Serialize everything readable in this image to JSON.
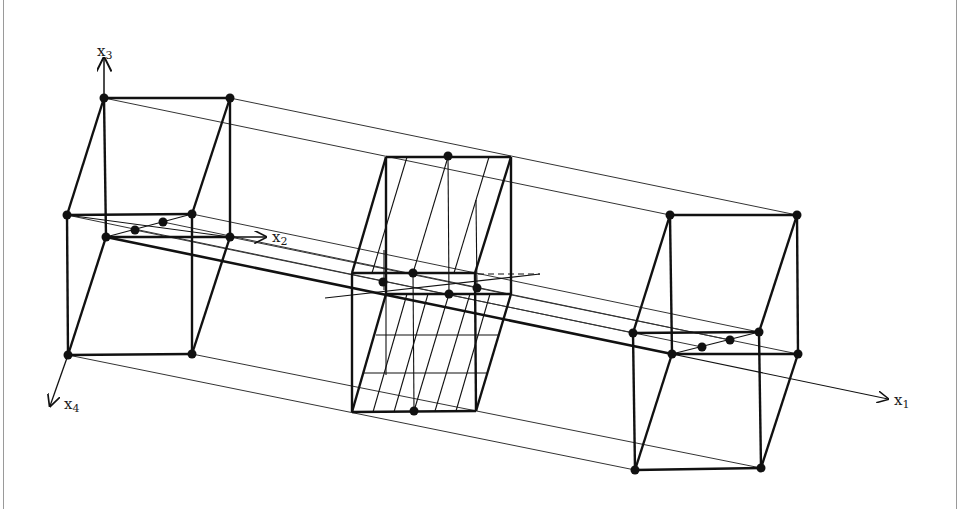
{
  "figure": {
    "axes": [
      {
        "name": "x1",
        "base": "x",
        "sub": "1"
      },
      {
        "name": "x2",
        "base": "x",
        "sub": "2"
      },
      {
        "name": "x3",
        "base": "x",
        "sub": "3"
      },
      {
        "name": "x4",
        "base": "x",
        "sub": "4"
      }
    ],
    "colors": {
      "stroke": "#111111",
      "thin": "#333333",
      "frame": "#9a9a9a"
    }
  },
  "labels": {
    "x1": {
      "base": "x",
      "sub": "1"
    },
    "x2": {
      "base": "x",
      "sub": "2"
    },
    "x3": {
      "base": "x",
      "sub": "3"
    },
    "x4": {
      "base": "x",
      "sub": "4"
    }
  }
}
